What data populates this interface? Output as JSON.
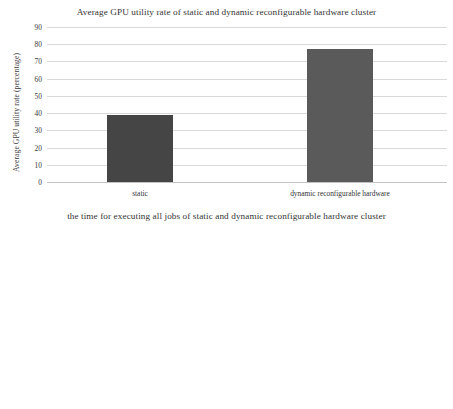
{
  "chart_data": [
    {
      "type": "bar",
      "title": "Average GPU utility rate of static and dynamic reconfigurable hardware cluster",
      "xlabel": "",
      "ylabel": "Average GPU utility rate (percentage)",
      "categories": [
        "static",
        "dynamic reconfigurable hardware"
      ],
      "values": [
        39,
        77
      ],
      "ylim": [
        0,
        90
      ],
      "ytick_step": 10,
      "yticks": [
        0,
        10,
        20,
        30,
        40,
        50,
        60,
        70,
        80,
        90
      ],
      "ytick_labels": [
        "0",
        "10",
        "20",
        "30",
        "40",
        "50",
        "60",
        "70",
        "80",
        "90"
      ],
      "grid": true,
      "legend": false,
      "bar_colors": [
        "#454545",
        "#5a5a5a"
      ]
    },
    {
      "type": "bar",
      "title": "the time for executing all jobs of static and dynamic reconfigurable hardware cluster",
      "xlabel": "",
      "ylabel": "all job executing time (hour)",
      "categories": [
        "static",
        "dynamic reconfigurabe hardware"
      ],
      "values": [
        24400,
        11900
      ],
      "ylim": [
        0,
        30000
      ],
      "ytick_step": 5000,
      "yticks": [
        0,
        5000,
        10000,
        15000,
        20000,
        25000,
        30000
      ],
      "ytick_labels": [
        "0",
        "5000",
        "10000",
        "15000",
        "20000",
        "25000",
        "30000"
      ],
      "grid": true,
      "legend": false,
      "bar_colors": [
        "#454545",
        "#5a5a5a"
      ]
    }
  ],
  "colors": {
    "background": "#ffffff",
    "gridline": "#d9d9d9",
    "baseline": "#c2c2c2",
    "text": "#333333",
    "bar_dark": "#454545",
    "bar_light": "#5a5a5a"
  }
}
